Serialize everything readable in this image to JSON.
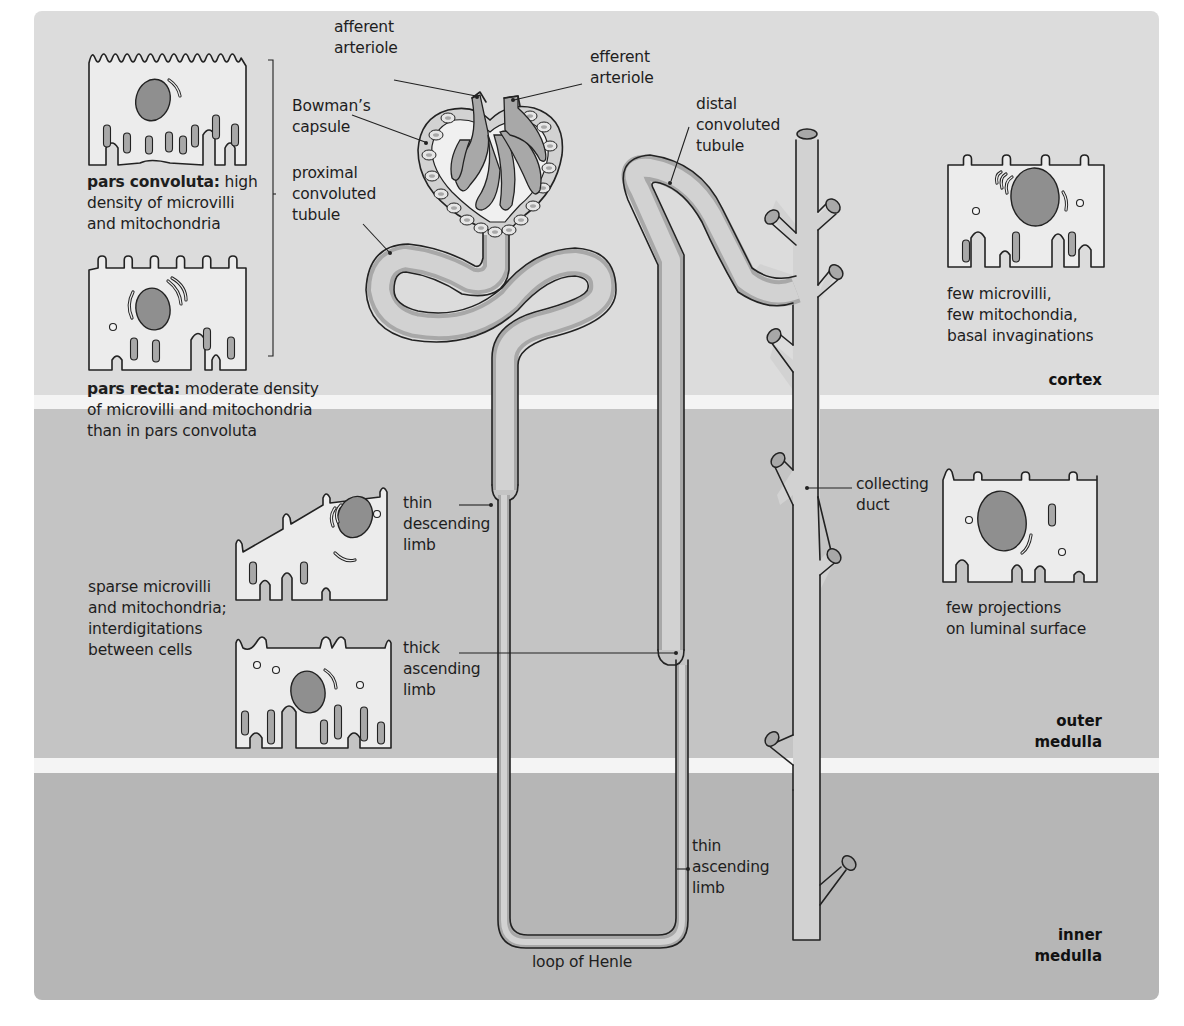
{
  "colors": {
    "cortex_bg": "#dcdcdc",
    "outer_medulla_bg": "#c4c4c4",
    "inner_medulla_bg": "#b6b6b6",
    "band_divider": "#f4f4f4",
    "tubule_fill": "#d2d2d2",
    "tubule_shade": "#a8a8a8",
    "cell_fill": "#ececec",
    "nucleus_fill": "#8f8f8f",
    "outline": "#222222"
  },
  "zones": {
    "cortex": "cortex",
    "outer_medulla": "outer\nmedulla",
    "inner_medulla": "inner\nmedulla"
  },
  "structure_labels": {
    "afferent_arteriole": "afferent\narteriole",
    "efferent_arteriole": "efferent\narteriole",
    "bowmans_capsule": "Bowman’s\ncapsule",
    "proximal_convoluted_tubule": "proximal\nconvoluted\ntubule",
    "distal_convoluted_tubule": "distal\nconvoluted\ntubule",
    "collecting_duct": "collecting\nduct",
    "thin_descending_limb": "thin\ndescending\nlimb",
    "thick_ascending_limb": "thick\nascending\nlimb",
    "thin_ascending_limb": "thin\nascending\nlimb",
    "loop_of_henle": "loop of Henle"
  },
  "cell_captions": {
    "pars_convoluta_term": "pars convoluta:",
    "pars_convoluta_text": " high\ndensity of microvilli\nand mitochondria",
    "pars_recta_term": "pars recta:",
    "pars_recta_text": " moderate density\nof microvilli and mitochondria\nthan in pars convoluta",
    "loop_cells": "sparse microvilli\nand mitochondria;\ninterdigitations\nbetween cells",
    "distal_cell": "few microvilli,\nfew mitochondia,\nbasal invaginations",
    "collecting_cell": "few projections\non luminal surface"
  }
}
